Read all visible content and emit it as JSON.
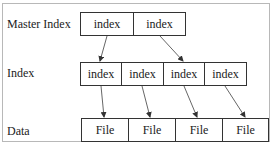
{
  "diagram": {
    "rows": [
      {
        "label": "Master Index",
        "cells": [
          "index",
          "index"
        ]
      },
      {
        "label": "Index",
        "cells": [
          "index",
          "index",
          "index",
          "index"
        ]
      },
      {
        "label": "Data",
        "cells": [
          "File",
          "File",
          "File",
          "File"
        ]
      }
    ],
    "arrows": [
      {
        "from": "master.0",
        "to": "index.0"
      },
      {
        "from": "master.1",
        "to": "index.2"
      },
      {
        "from": "index.0",
        "to": "data.0"
      },
      {
        "from": "index.1",
        "to": "data.1"
      },
      {
        "from": "index.2",
        "to": "data.2"
      },
      {
        "from": "index.3",
        "to": "data.3"
      }
    ]
  }
}
